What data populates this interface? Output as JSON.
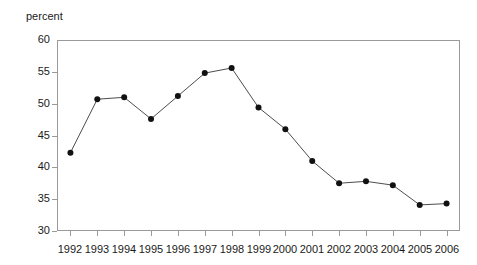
{
  "chart_data": {
    "type": "line",
    "title": "",
    "subtitle": "",
    "xlabel": "",
    "ylabel": "percent",
    "categories": [
      "1992",
      "1993",
      "1994",
      "1995",
      "1996",
      "1997",
      "1998",
      "1999",
      "2000",
      "2001",
      "2002",
      "2003",
      "2004",
      "2005",
      "2006"
    ],
    "values": [
      42.3,
      50.7,
      51.0,
      47.6,
      51.2,
      54.8,
      55.6,
      49.4,
      46.0,
      41.0,
      37.5,
      37.8,
      37.2,
      34.1,
      34.3
    ],
    "series": [
      {
        "name": "percent",
        "values": [
          42.3,
          50.7,
          51.0,
          47.6,
          51.2,
          54.8,
          55.6,
          49.4,
          46.0,
          41.0,
          37.5,
          37.8,
          37.2,
          34.1,
          34.3
        ]
      }
    ],
    "ylim": [
      30,
      60
    ],
    "y_ticks": [
      "30",
      "35",
      "40",
      "45",
      "50",
      "55",
      "60"
    ],
    "y_tick_values": [
      30,
      35,
      40,
      45,
      50,
      55,
      60
    ],
    "xlim_categories": [
      "1992",
      "2006"
    ],
    "grid": false,
    "legend": false,
    "legend_position": "none",
    "marker": "filled-circle",
    "line_color": "#4d4d4d",
    "marker_color": "#111111",
    "axis_color": "#9a9a9a",
    "background_color": "#ffffff"
  }
}
